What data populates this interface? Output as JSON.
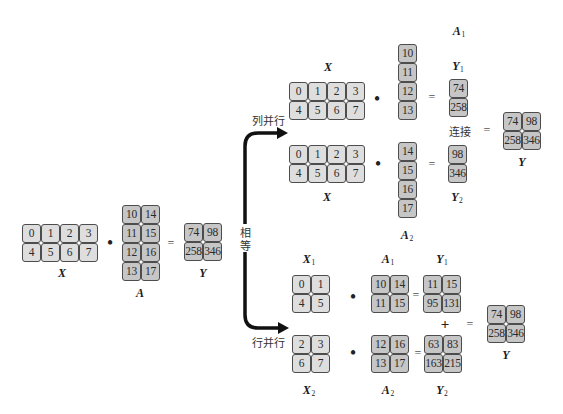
{
  "colors": {
    "light_cell": "#dedede",
    "dark_cell": "#c6c6c6",
    "cell_border": "#4d4d4d",
    "arrow": "#111111"
  },
  "operators": {
    "dot": "•",
    "equals": "=",
    "plus": "+"
  },
  "text": {
    "equal_char_1": "相",
    "equal_char_2": "等",
    "column_parallel": "列并行",
    "row_parallel": "行并行",
    "concat": "连接"
  },
  "original": {
    "X": {
      "label": "X",
      "sub": "",
      "rows": [
        [
          0,
          1,
          2,
          3
        ],
        [
          4,
          5,
          6,
          7
        ]
      ]
    },
    "A": {
      "label": "A",
      "sub": "",
      "rows": [
        [
          10,
          14
        ],
        [
          11,
          15
        ],
        [
          12,
          16
        ],
        [
          13,
          17
        ]
      ]
    },
    "Y": {
      "label": "Y",
      "sub": "",
      "rows": [
        [
          74,
          98
        ],
        [
          258,
          346
        ]
      ]
    }
  },
  "column_parallel": {
    "X_top": {
      "label": "X",
      "sub": "",
      "rows": [
        [
          0,
          1,
          2,
          3
        ],
        [
          4,
          5,
          6,
          7
        ]
      ]
    },
    "A1": {
      "label": "A",
      "sub": "1",
      "rows": [
        [
          10
        ],
        [
          11
        ],
        [
          12
        ],
        [
          13
        ]
      ]
    },
    "Y1": {
      "label": "Y",
      "sub": "1",
      "rows": [
        [
          74
        ],
        [
          258
        ]
      ]
    },
    "X_bottom": {
      "label": "X",
      "sub": "",
      "rows": [
        [
          0,
          1,
          2,
          3
        ],
        [
          4,
          5,
          6,
          7
        ]
      ]
    },
    "A2": {
      "label": "A",
      "sub": "2",
      "rows": [
        [
          14
        ],
        [
          15
        ],
        [
          16
        ],
        [
          17
        ]
      ]
    },
    "Y2": {
      "label": "Y",
      "sub": "2",
      "rows": [
        [
          98
        ],
        [
          346
        ]
      ]
    },
    "Y": {
      "label": "Y",
      "sub": "",
      "rows": [
        [
          74,
          98
        ],
        [
          258,
          346
        ]
      ]
    }
  },
  "row_parallel": {
    "X1": {
      "label": "X",
      "sub": "1",
      "rows": [
        [
          0,
          1
        ],
        [
          4,
          5
        ]
      ]
    },
    "A1": {
      "label": "A",
      "sub": "1",
      "rows": [
        [
          10,
          14
        ],
        [
          11,
          15
        ]
      ]
    },
    "Y1": {
      "label": "Y",
      "sub": "1",
      "rows": [
        [
          11,
          15
        ],
        [
          95,
          131
        ]
      ]
    },
    "X2": {
      "label": "X",
      "sub": "2",
      "rows": [
        [
          2,
          3
        ],
        [
          6,
          7
        ]
      ]
    },
    "A2": {
      "label": "A",
      "sub": "2",
      "rows": [
        [
          12,
          16
        ],
        [
          13,
          17
        ]
      ]
    },
    "Y2": {
      "label": "Y",
      "sub": "2",
      "rows": [
        [
          63,
          83
        ],
        [
          163,
          215
        ]
      ]
    },
    "Y": {
      "label": "Y",
      "sub": "",
      "rows": [
        [
          74,
          98
        ],
        [
          258,
          346
        ]
      ]
    }
  }
}
